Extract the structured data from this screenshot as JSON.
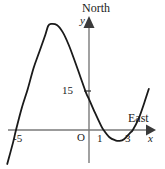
{
  "figure": {
    "axes": {
      "north_label": "North",
      "east_label": "East",
      "y_axis_symbol": "y",
      "x_axis_symbol": "x",
      "origin_label": "O"
    },
    "tick_labels": {
      "y_15": "15",
      "x_minus5": "-5",
      "x_1": "1",
      "x_3": "3"
    },
    "colors": {
      "curve": "#1a1a1a",
      "axis": "#6b6b6b",
      "text": "#1a1a1a",
      "background": "#ffffff"
    }
  },
  "chart_data": {
    "type": "line",
    "title": "",
    "xlabel": "East",
    "ylabel": "North",
    "x_axis_symbol": "x",
    "y_axis_symbol": "y",
    "grid": false,
    "legend": null,
    "xlim": [
      -6.2,
      4.6
    ],
    "ylim": [
      -12,
      62
    ],
    "x_ticks": [
      -5,
      1,
      3
    ],
    "x_tick_labels": [
      "-5",
      "1",
      "3"
    ],
    "y_ticks": [
      15
    ],
    "y_tick_labels": [
      "15"
    ],
    "origin_label": "O",
    "annotations": [
      {
        "text": "North",
        "position": "top of y-axis"
      },
      {
        "text": "East",
        "position": "right of x-axis"
      }
    ],
    "roots": [
      -5,
      1,
      3
    ],
    "y_intercept": 15,
    "local_maximum": {
      "x": -2.8,
      "y": 52
    },
    "local_minimum": {
      "x": 2.1,
      "y": -4.5
    },
    "series": [
      {
        "name": "cubic",
        "x": [
          -5.6,
          -5.2,
          -5.0,
          -4.6,
          -4.2,
          -3.8,
          -3.4,
          -3.0,
          -2.8,
          -2.6,
          -2.2,
          -1.8,
          -1.4,
          -1.0,
          -0.6,
          -0.2,
          0.0,
          0.4,
          0.8,
          1.0,
          1.4,
          1.8,
          2.1,
          2.4,
          2.8,
          3.0,
          3.4,
          3.8,
          4.1
        ],
        "y": [
          -16.5,
          -6.0,
          0.0,
          10.8,
          19.8,
          30.0,
          38.0,
          46.0,
          50.5,
          51.5,
          51.0,
          47.5,
          41.5,
          34.0,
          26.0,
          18.0,
          15.0,
          8.5,
          2.5,
          0.0,
          -3.5,
          -5.0,
          -5.3,
          -4.5,
          -1.5,
          0.0,
          5.5,
          13.5,
          20.0
        ]
      }
    ]
  }
}
